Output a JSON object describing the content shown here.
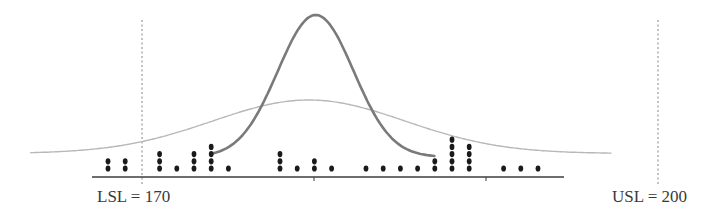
{
  "chart_data": {
    "type": "scatter",
    "subtype": "dot-plot with fitted normal curves and specification limits",
    "title": "",
    "xlabel": "",
    "ylabel": "",
    "xlim": [
      165.5,
      201.5
    ],
    "x_ticks": [
      180,
      190
    ],
    "x_tick_labels": [
      "",
      ""
    ],
    "grid": false,
    "legend": null,
    "spec_limits": {
      "lsl": {
        "value": 170,
        "label": "LSL = 170",
        "style": "dotted"
      },
      "usl": {
        "value": 200,
        "label": "USL = 200",
        "style": "dotted"
      }
    },
    "dot_plot": {
      "values": [
        168,
        169,
        171,
        172,
        173,
        174,
        175,
        178,
        179,
        180,
        181,
        183,
        184,
        185,
        186,
        187,
        188,
        189,
        191,
        192,
        193
      ],
      "counts": [
        2,
        2,
        3,
        1,
        3,
        4,
        1,
        3,
        1,
        2,
        1,
        1,
        1,
        1,
        1,
        2,
        5,
        4,
        1,
        1,
        1
      ],
      "total_points": 41
    },
    "curves": [
      {
        "name": "narrow-distribution",
        "kind": "normal",
        "mean": 180.1,
        "sd": 2.2,
        "x_range": [
          174,
          187
        ],
        "color": "#7a7a7a",
        "width": 2.6
      },
      {
        "name": "wide-distribution",
        "kind": "normal",
        "mean": 179.7,
        "sd": 5.6,
        "x_range": [
          163.5,
          197.3
        ],
        "color": "#b8b8b8",
        "width": 1.4
      }
    ],
    "annotations": [
      "LSL = 170",
      "USL = 200"
    ]
  },
  "labels": {
    "lsl": "LSL = 170",
    "usl": "USL = 200"
  },
  "colors": {
    "axis": "#3c3c3c",
    "dots": "#1a1a1a",
    "spec_line": "#9a9a9a",
    "narrow_curve": "#7a7a7a",
    "wide_curve": "#b8b8b8",
    "text": "#3a3a3a"
  }
}
